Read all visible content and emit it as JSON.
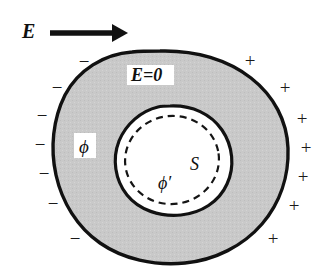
{
  "figure": {
    "name": "conductor-with-cavity-electrostatics-diagram",
    "background_color": "#ffffff",
    "conductor_fill_color": "#c9c9c9",
    "outline_color": "#111111",
    "cavity_fill_color": "#ffffff"
  },
  "external_field": {
    "label": "E",
    "arrow_name": "field-direction-arrow",
    "direction": "right"
  },
  "annotations": {
    "interior_field": "E=0",
    "conductor_potential": "ϕ",
    "cavity_potential": "ϕ′",
    "cavity_surface": "S"
  },
  "charges": {
    "negative_label": "−",
    "positive_label": "+",
    "negative_positions": [
      {
        "x": 84,
        "y": 64
      },
      {
        "x": 57,
        "y": 90
      },
      {
        "x": 42,
        "y": 118
      },
      {
        "x": 40,
        "y": 147
      },
      {
        "x": 44,
        "y": 176
      },
      {
        "x": 53,
        "y": 206
      },
      {
        "x": 75,
        "y": 241
      }
    ],
    "positive_positions": [
      {
        "x": 250,
        "y": 63
      },
      {
        "x": 285,
        "y": 90
      },
      {
        "x": 302,
        "y": 121
      },
      {
        "x": 306,
        "y": 150
      },
      {
        "x": 303,
        "y": 179
      },
      {
        "x": 294,
        "y": 208
      },
      {
        "x": 273,
        "y": 241
      }
    ]
  },
  "geometry": {
    "outer_blob_path": "M 160,51 C 196,50 228,60 251,78 C 274,96 287,121 288,148 C 289,176 280,203 262,224 C 243,246 215,260 185,263 C 154,266 123,259 100,243 C 77,227 62,202 56,175 C 50,148 53,119 65,95 C 78,70 104,54 132,52 C 141,51 151,51 160,51 Z",
    "cavity_blob_path": "M 170,106 C 192,105 211,114 222,130 C 233,146 235,167 227,184 C 219,202 201,213 181,215 C 160,217 139,210 127,195 C 115,180 112,159 119,141 C 126,124 141,111 158,107 C 162,106 166,106 170,106 Z",
    "dashed_circle": {
      "cx": 172,
      "cy": 160,
      "rx": 47,
      "ry": 44,
      "rotation": -8
    }
  },
  "label_positions": {
    "E_field": {
      "x": 22,
      "y": 38
    },
    "E_zero_box": {
      "x": 127,
      "y": 65,
      "w": 47,
      "h": 20
    },
    "E_zero_text": {
      "x": 131,
      "y": 81
    },
    "phi_box": {
      "x": 74,
      "y": 133,
      "w": 22,
      "h": 25
    },
    "phi_text": {
      "x": 79,
      "y": 153
    },
    "S_text": {
      "x": 190,
      "y": 170
    },
    "phi_prime_text": {
      "x": 158,
      "y": 189
    }
  },
  "arrow": {
    "shaft_x1": 50,
    "shaft_x2": 112,
    "y": 33,
    "tip_x": 128,
    "head_half_height": 9
  }
}
